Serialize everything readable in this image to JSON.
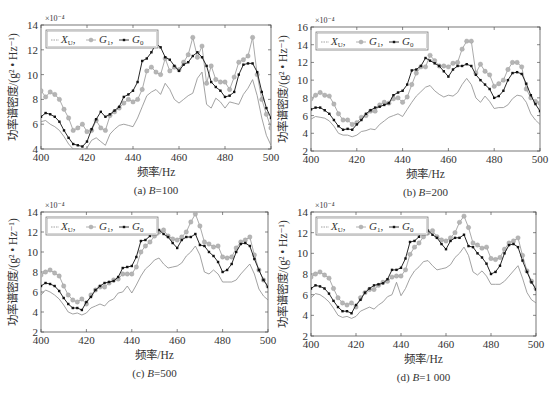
{
  "figure": {
    "colors": {
      "X_U": "#8a8a8a",
      "G_1": "#a0a0a0",
      "G_1_marker": "#b5b5b5",
      "G_0": "#111111",
      "axis": "#555555"
    }
  },
  "chart_data": [
    {
      "id": "a",
      "type": "line",
      "caption": "(a) B=100",
      "caption_prefix": "(a) ",
      "caption_var": "B",
      "caption_value": "=100",
      "xlabel": "频率/Hz",
      "ylabel": "功率谱密度/(g² • Hz⁻¹)",
      "y_exponent": "×10⁻⁴",
      "xlim": [
        400,
        500
      ],
      "ylim": [
        4,
        14
      ],
      "xticks": [
        400,
        420,
        440,
        460,
        480,
        500
      ],
      "yticks": [
        4,
        6,
        8,
        10,
        12,
        14
      ],
      "grid": false,
      "legend": {
        "position": "upper left",
        "entries": [
          "X_U",
          "G_1",
          "G_0"
        ]
      },
      "frame": {
        "left": 41,
        "top": 25,
        "right": 271,
        "bottom": 149
      },
      "x": [
        400,
        402,
        404,
        406,
        408,
        410,
        412,
        414,
        416,
        418,
        420,
        422,
        424,
        426,
        428,
        430,
        432,
        434,
        436,
        438,
        440,
        442,
        444,
        446,
        448,
        450,
        452,
        454,
        456,
        458,
        460,
        462,
        464,
        466,
        468,
        470,
        472,
        474,
        476,
        478,
        480,
        482,
        484,
        486,
        488,
        490,
        492,
        494,
        496,
        498,
        500
      ],
      "series": [
        {
          "name": "X_U",
          "values": [
            6.2,
            6.3,
            6.0,
            5.8,
            5.5,
            5.0,
            4.4,
            4.0,
            4.0,
            3.9,
            4.1,
            4.7,
            4.9,
            4.6,
            4.3,
            5.2,
            5.6,
            5.9,
            6.0,
            5.9,
            5.8,
            6.5,
            7.4,
            8.3,
            8.6,
            8.8,
            8.4,
            9.3,
            8.8,
            8.0,
            7.7,
            8.0,
            8.3,
            8.5,
            9.7,
            10.2,
            7.6,
            7.3,
            8.1,
            7.8,
            7.3,
            7.8,
            7.7,
            7.6,
            8.4,
            8.9,
            9.6,
            8.3,
            6.5,
            5.1,
            4.3
          ]
        },
        {
          "name": "G_1",
          "values": [
            8.7,
            8.2,
            8.6,
            8.4,
            8.0,
            7.2,
            6.5,
            5.5,
            5.7,
            6.0,
            5.4,
            5.5,
            6.3,
            5.7,
            5.5,
            6.7,
            7.0,
            7.3,
            7.7,
            8.0,
            7.8,
            8.0,
            8.8,
            10.3,
            10.6,
            10.2,
            10.0,
            11.3,
            10.3,
            10.6,
            10.4,
            11.0,
            11.6,
            13.0,
            11.4,
            12.3,
            9.3,
            10.7,
            9.6,
            9.4,
            9.4,
            8.8,
            9.8,
            11.0,
            11.2,
            11.5,
            13.0,
            10.0,
            8.0,
            6.8,
            5.7
          ]
        },
        {
          "name": "G_0",
          "values": [
            6.6,
            6.9,
            6.8,
            6.6,
            6.2,
            5.5,
            4.9,
            4.4,
            4.3,
            4.2,
            4.6,
            5.6,
            6.4,
            7.0,
            6.6,
            6.8,
            7.1,
            7.4,
            8.2,
            8.4,
            8.7,
            9.4,
            11.1,
            11.3,
            11.8,
            12.5,
            12.2,
            11.4,
            11.2,
            10.7,
            10.3,
            10.8,
            11.0,
            11.5,
            11.8,
            11.4,
            10.7,
            9.4,
            9.0,
            8.7,
            8.2,
            8.3,
            8.6,
            10.0,
            10.8,
            10.9,
            10.9,
            10.2,
            8.6,
            7.3,
            6.5
          ]
        }
      ]
    },
    {
      "id": "b",
      "type": "line",
      "caption": "(b) B=200",
      "caption_prefix": "(b) ",
      "caption_var": "B",
      "caption_value": "=200",
      "xlabel": "频率/Hz",
      "ylabel": "功率谱密度/(g² • Hz⁻¹)",
      "y_exponent": "×10⁻⁴",
      "xlim": [
        400,
        500
      ],
      "ylim": [
        2,
        16
      ],
      "xticks": [
        400,
        420,
        440,
        460,
        480,
        500
      ],
      "yticks": [
        2,
        4,
        6,
        8,
        10,
        12,
        14,
        16
      ],
      "grid": false,
      "legend": {
        "position": "upper left",
        "entries": [
          "X_U",
          "G_1",
          "G_0"
        ]
      },
      "frame": {
        "left": 311,
        "top": 27,
        "right": 540,
        "bottom": 151
      },
      "x": [
        400,
        402,
        404,
        406,
        408,
        410,
        412,
        414,
        416,
        418,
        420,
        422,
        424,
        426,
        428,
        430,
        432,
        434,
        436,
        438,
        440,
        442,
        444,
        446,
        448,
        450,
        452,
        454,
        456,
        458,
        460,
        462,
        464,
        466,
        468,
        470,
        472,
        474,
        476,
        478,
        480,
        482,
        484,
        486,
        488,
        490,
        492,
        494,
        496,
        498,
        500
      ],
      "series": [
        {
          "name": "X_U",
          "values": [
            5.6,
            5.9,
            5.8,
            5.7,
            5.4,
            4.8,
            4.0,
            3.8,
            3.8,
            3.6,
            3.8,
            4.2,
            4.3,
            4.5,
            4.4,
            5.0,
            5.4,
            5.8,
            6.0,
            6.2,
            5.9,
            6.7,
            7.5,
            8.2,
            8.7,
            9.2,
            9.4,
            8.8,
            8.4,
            8.1,
            8.3,
            8.2,
            8.6,
            9.5,
            10.2,
            9.5,
            8.0,
            7.5,
            8.2,
            7.6,
            6.8,
            6.9,
            6.9,
            7.2,
            7.9,
            8.3,
            8.2,
            7.5,
            6.2,
            5.5,
            5.0
          ]
        },
        {
          "name": "G_1",
          "values": [
            7.9,
            8.3,
            8.6,
            8.3,
            8.2,
            7.3,
            6.2,
            5.5,
            5.5,
            5.0,
            5.2,
            5.8,
            6.0,
            6.5,
            6.5,
            7.2,
            7.5,
            7.4,
            7.9,
            8.0,
            7.5,
            8.1,
            9.5,
            10.8,
            11.5,
            11.5,
            12.8,
            12.2,
            11.6,
            11.6,
            11.5,
            11.9,
            12.0,
            13.5,
            14.4,
            14.4,
            10.8,
            11.8,
            11.0,
            10.6,
            9.3,
            9.6,
            10.0,
            11.2,
            12.0,
            12.0,
            11.5,
            9.0,
            8.0,
            7.6,
            7.4
          ]
        },
        {
          "name": "G_0",
          "values": [
            6.7,
            6.9,
            6.9,
            6.6,
            6.2,
            5.5,
            4.8,
            4.4,
            4.5,
            4.4,
            5.0,
            5.5,
            6.2,
            6.6,
            6.9,
            7.0,
            7.2,
            7.4,
            8.3,
            8.6,
            8.8,
            9.5,
            11.1,
            11.2,
            11.6,
            12.5,
            12.2,
            11.9,
            11.6,
            11.0,
            10.4,
            11.2,
            11.6,
            11.6,
            11.8,
            11.6,
            10.6,
            10.0,
            9.5,
            9.0,
            8.0,
            8.2,
            8.8,
            10.0,
            10.8,
            10.9,
            10.7,
            9.6,
            8.3,
            7.3,
            6.5
          ]
        }
      ]
    },
    {
      "id": "c",
      "type": "line",
      "caption": "(c) B=500",
      "caption_prefix": "(c) ",
      "caption_var": "B",
      "caption_value": "=500",
      "xlabel": "频率/Hz",
      "ylabel": "功率谱密度/(g² • Hz⁻¹)",
      "y_exponent": "×10⁻⁴",
      "xlim": [
        400,
        500
      ],
      "ylim": [
        2,
        14
      ],
      "xticks": [
        400,
        420,
        440,
        460,
        480,
        500
      ],
      "yticks": [
        2,
        4,
        6,
        8,
        10,
        12,
        14
      ],
      "grid": false,
      "legend": {
        "position": "upper left",
        "entries": [
          "X_U",
          "G_1",
          "G_0"
        ]
      },
      "frame": {
        "left": 41,
        "top": 212,
        "right": 268,
        "bottom": 332
      },
      "x": [
        400,
        402,
        404,
        406,
        408,
        410,
        412,
        414,
        416,
        418,
        420,
        422,
        424,
        426,
        428,
        430,
        432,
        434,
        436,
        438,
        440,
        442,
        444,
        446,
        448,
        450,
        452,
        454,
        456,
        458,
        460,
        462,
        464,
        466,
        468,
        470,
        472,
        474,
        476,
        478,
        480,
        482,
        484,
        486,
        488,
        490,
        492,
        494,
        496,
        498,
        500
      ],
      "series": [
        {
          "name": "X_U",
          "values": [
            5.7,
            6.2,
            6.0,
            5.7,
            5.3,
            4.7,
            4.0,
            3.8,
            3.9,
            3.7,
            3.9,
            4.4,
            4.6,
            4.8,
            4.6,
            5.1,
            5.3,
            5.9,
            6.0,
            6.6,
            5.9,
            6.7,
            7.6,
            8.3,
            8.7,
            9.2,
            9.4,
            8.8,
            8.4,
            8.5,
            8.6,
            8.9,
            9.6,
            10.0,
            10.6,
            9.7,
            8.0,
            7.8,
            8.2,
            7.8,
            7.0,
            7.0,
            7.0,
            7.2,
            7.8,
            8.3,
            8.8,
            7.8,
            6.3,
            5.6,
            5.2
          ]
        },
        {
          "name": "G_1",
          "values": [
            7.7,
            8.0,
            8.2,
            7.9,
            7.6,
            6.6,
            5.7,
            5.2,
            5.0,
            5.3,
            4.8,
            5.7,
            6.2,
            6.5,
            6.5,
            6.9,
            7.2,
            7.3,
            7.8,
            7.8,
            7.8,
            8.5,
            10.0,
            10.6,
            11.0,
            11.6,
            12.0,
            12.2,
            11.6,
            11.3,
            11.2,
            11.5,
            12.0,
            13.0,
            13.8,
            12.6,
            11.0,
            10.8,
            10.5,
            10.6,
            9.5,
            9.4,
            9.5,
            10.4,
            11.0,
            11.2,
            11.5,
            9.7,
            8.2,
            7.2,
            6.6
          ]
        },
        {
          "name": "G_0",
          "values": [
            6.6,
            6.9,
            6.8,
            6.6,
            6.1,
            5.4,
            4.8,
            4.4,
            4.4,
            4.2,
            5.0,
            5.5,
            6.2,
            6.6,
            6.9,
            7.0,
            7.1,
            7.5,
            8.4,
            8.5,
            8.6,
            9.5,
            11.1,
            11.2,
            11.6,
            12.6,
            12.2,
            11.8,
            11.5,
            10.9,
            10.4,
            11.2,
            11.5,
            11.5,
            11.8,
            10.7,
            10.6,
            10.0,
            9.6,
            9.0,
            8.0,
            8.2,
            8.8,
            10.0,
            10.8,
            10.9,
            10.6,
            9.3,
            8.2,
            7.2,
            6.5
          ]
        }
      ]
    },
    {
      "id": "d",
      "type": "line",
      "caption": "(d) B=1 000",
      "caption_prefix": "(d) ",
      "caption_var": "B",
      "caption_value": "=1 000",
      "xlabel": "频率/Hz",
      "ylabel": "功率谱密度/(g² • Hz⁻¹)",
      "y_exponent": "×10⁻⁴",
      "xlim": [
        400,
        500
      ],
      "ylim": [
        2,
        14
      ],
      "xticks": [
        400,
        420,
        440,
        460,
        480,
        500
      ],
      "yticks": [
        2,
        4,
        6,
        8,
        10,
        12,
        14
      ],
      "grid": false,
      "legend": {
        "position": "upper left",
        "entries": [
          "X_U",
          "G_1",
          "G_0"
        ]
      },
      "frame": {
        "left": 311,
        "top": 212,
        "right": 536,
        "bottom": 336
      },
      "x": [
        400,
        402,
        404,
        406,
        408,
        410,
        412,
        414,
        416,
        418,
        420,
        422,
        424,
        426,
        428,
        430,
        432,
        434,
        436,
        438,
        440,
        442,
        444,
        446,
        448,
        450,
        452,
        454,
        456,
        458,
        460,
        462,
        464,
        466,
        468,
        470,
        472,
        474,
        476,
        478,
        480,
        482,
        484,
        486,
        488,
        490,
        492,
        494,
        496,
        498,
        500
      ],
      "series": [
        {
          "name": "X_U",
          "values": [
            5.7,
            6.1,
            6.0,
            5.7,
            5.3,
            4.7,
            4.0,
            3.8,
            3.9,
            3.7,
            3.9,
            4.4,
            4.6,
            4.8,
            4.6,
            5.0,
            5.3,
            5.8,
            6.0,
            7.2,
            5.9,
            6.6,
            7.6,
            8.3,
            8.7,
            9.2,
            9.3,
            8.8,
            8.4,
            8.5,
            8.6,
            8.9,
            9.6,
            10.0,
            10.6,
            9.8,
            8.2,
            7.9,
            8.3,
            7.8,
            7.0,
            7.0,
            7.0,
            7.3,
            7.8,
            8.3,
            8.8,
            7.6,
            6.2,
            5.5,
            5.2
          ]
        },
        {
          "name": "G_1",
          "values": [
            7.7,
            8.0,
            8.2,
            7.9,
            7.6,
            6.6,
            5.7,
            5.2,
            5.0,
            5.2,
            4.8,
            5.7,
            6.2,
            6.5,
            6.5,
            6.9,
            7.2,
            7.3,
            7.7,
            7.8,
            7.8,
            8.4,
            9.9,
            10.6,
            11.0,
            11.6,
            12.0,
            12.2,
            11.6,
            11.3,
            11.2,
            11.5,
            12.0,
            13.0,
            13.6,
            12.5,
            11.0,
            10.8,
            10.5,
            10.6,
            9.5,
            9.4,
            9.6,
            10.4,
            11.0,
            11.2,
            11.5,
            9.8,
            8.3,
            7.3,
            6.6
          ]
        },
        {
          "name": "G_0",
          "values": [
            6.6,
            6.9,
            6.8,
            6.6,
            6.1,
            5.4,
            4.8,
            4.4,
            4.4,
            4.2,
            5.0,
            5.5,
            6.2,
            6.6,
            6.9,
            7.0,
            7.1,
            7.5,
            8.4,
            8.4,
            8.6,
            9.5,
            11.1,
            11.2,
            11.6,
            12.6,
            12.2,
            11.8,
            11.5,
            10.9,
            10.4,
            11.2,
            11.5,
            11.5,
            11.8,
            10.7,
            10.6,
            10.0,
            9.6,
            9.0,
            8.0,
            8.2,
            8.8,
            10.0,
            10.8,
            10.9,
            10.6,
            9.3,
            8.2,
            7.2,
            6.5
          ]
        }
      ]
    }
  ]
}
